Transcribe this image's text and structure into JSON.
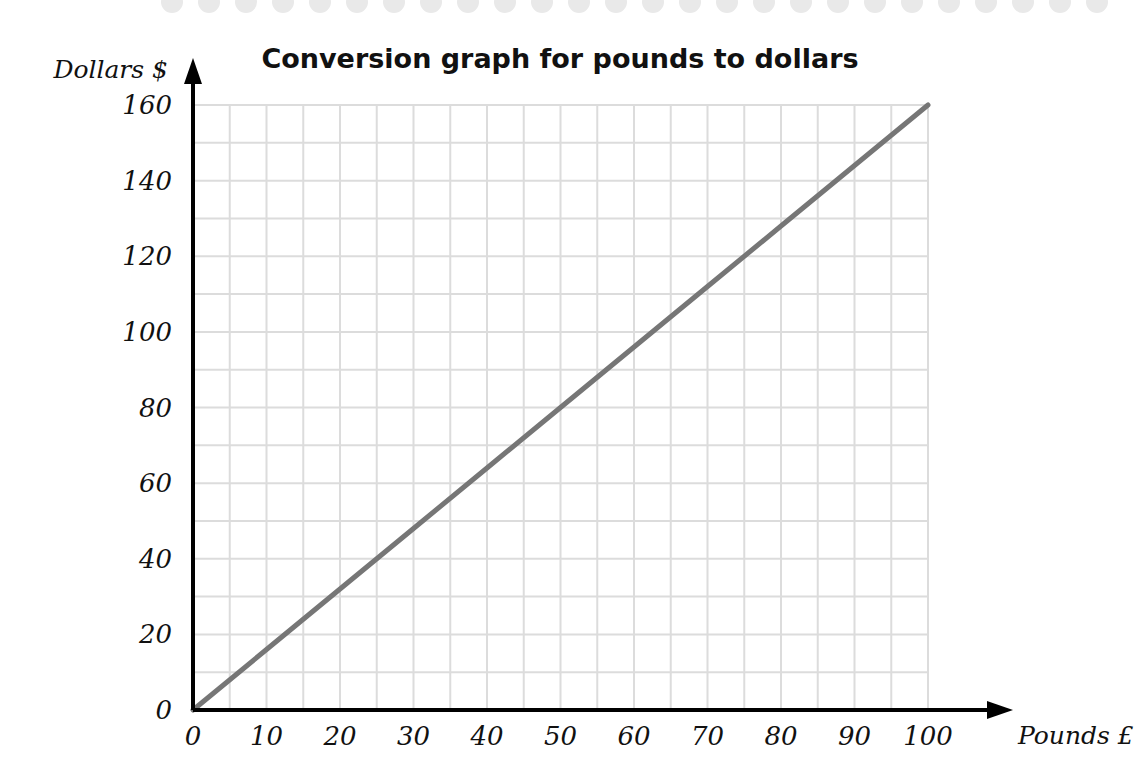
{
  "page": {
    "background_color": "#ffffff",
    "perforation": {
      "name": "top-perforated-edge",
      "color": "#e9e9e9",
      "dot_count": 30,
      "dot_diameter": 22,
      "spacing": 37,
      "start_x": 172,
      "end_x": 1120
    }
  },
  "chart_data": {
    "type": "line",
    "title": "Conversion graph for pounds to dollars",
    "xlabel": "Pounds £",
    "ylabel": "Dollars $",
    "xlim": [
      0,
      100
    ],
    "ylim": [
      0,
      160
    ],
    "x_ticks": [
      0,
      10,
      20,
      30,
      40,
      50,
      60,
      70,
      80,
      90,
      100
    ],
    "y_ticks": [
      0,
      20,
      40,
      60,
      80,
      100,
      120,
      140,
      160
    ],
    "x_minor_step": 5,
    "y_minor_step": 10,
    "grid": true,
    "grid_color": "#dcdcdc",
    "axis_color": "#000000",
    "legend": null,
    "series": [
      {
        "name": "pounds to dollars",
        "color": "#767676",
        "line_width": 5,
        "x": [
          0,
          10,
          20,
          30,
          40,
          50,
          60,
          70,
          80,
          90,
          100
        ],
        "values": [
          0,
          16,
          32,
          48,
          64,
          80,
          96,
          112,
          128,
          144,
          160
        ],
        "rate_dollars_per_pound": 1.6
      }
    ],
    "annotations": []
  },
  "axes": {
    "x_axis_name": "x-axis-pounds",
    "y_axis_name": "y-axis-dollars",
    "x_arrow": true,
    "y_arrow": true
  }
}
